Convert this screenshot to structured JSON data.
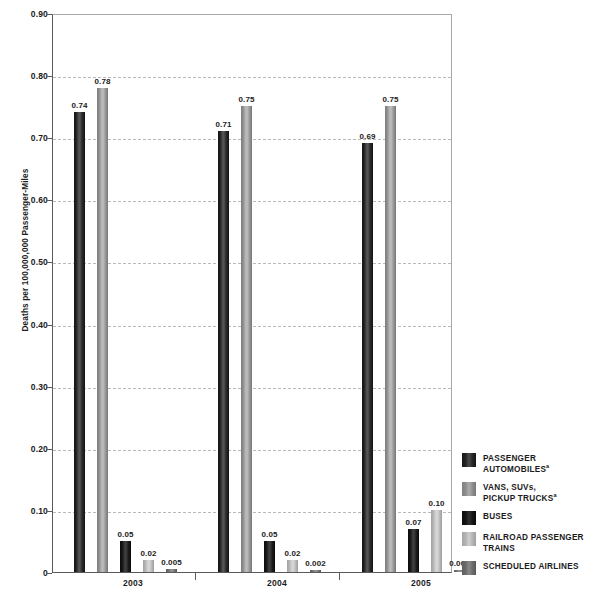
{
  "chart_data": {
    "type": "bar",
    "title": "",
    "subtitle": "",
    "xlabel": "",
    "ylabel": "Deaths per 100,000,000 Passenger-Miles",
    "categories": [
      "2003",
      "2004",
      "2005"
    ],
    "ylim": [
      0,
      0.9
    ],
    "ytick_labels": [
      "0.90",
      "0.80",
      "0.70",
      "0.60",
      "0.50",
      "0.40",
      "0.30",
      "0.20",
      "0.10",
      "0"
    ],
    "ytick_values": [
      0.9,
      0.8,
      0.7,
      0.6,
      0.5,
      0.4,
      0.3,
      0.2,
      0.1,
      0
    ],
    "grid": "horizontal-dashed",
    "legend_position": "right",
    "series": [
      {
        "name": "PASSENGER AUTOMOBILES",
        "footnote": "a",
        "color": "#1f1f1f",
        "values": [
          0.74,
          0.71,
          0.69
        ],
        "labels": [
          "0.74",
          "0.71",
          "0.69"
        ]
      },
      {
        "name": "VANS, SUVs, PICKUP TRUCKS",
        "footnote": "a",
        "color": "#a0a0a0",
        "values": [
          0.78,
          0.75,
          0.75
        ],
        "labels": [
          "0.78",
          "0.75",
          "0.75"
        ]
      },
      {
        "name": "BUSES",
        "footnote": "",
        "color": "#101010",
        "values": [
          0.05,
          0.05,
          0.07
        ],
        "labels": [
          "0.05",
          "0.05",
          "0.07"
        ]
      },
      {
        "name": "RAILROAD PASSENGER TRAINS",
        "footnote": "",
        "color": "#c4c4c4",
        "values": [
          0.02,
          0.02,
          0.1
        ],
        "labels": [
          "0.02",
          "0.02",
          "0.10"
        ]
      },
      {
        "name": "SCHEDULED AIRLINES",
        "footnote": "",
        "color": "#7d7d7d",
        "values": [
          0.005,
          0.002,
          0.003
        ],
        "labels": [
          "0.005",
          "0.002",
          "0.003"
        ]
      }
    ]
  },
  "legend": {
    "items": [
      {
        "line1": "PASSENGER",
        "line2": "AUTOMOBILES",
        "sup": "a"
      },
      {
        "line1": "VANS, SUVs,",
        "line2": "PICKUP TRUCKS",
        "sup": "a"
      },
      {
        "line1": "BUSES",
        "line2": "",
        "sup": ""
      },
      {
        "line1": "RAILROAD PASSENGER",
        "line2": "TRAINS",
        "sup": ""
      },
      {
        "line1": "SCHEDULED AIRLINES",
        "line2": "",
        "sup": ""
      }
    ]
  }
}
